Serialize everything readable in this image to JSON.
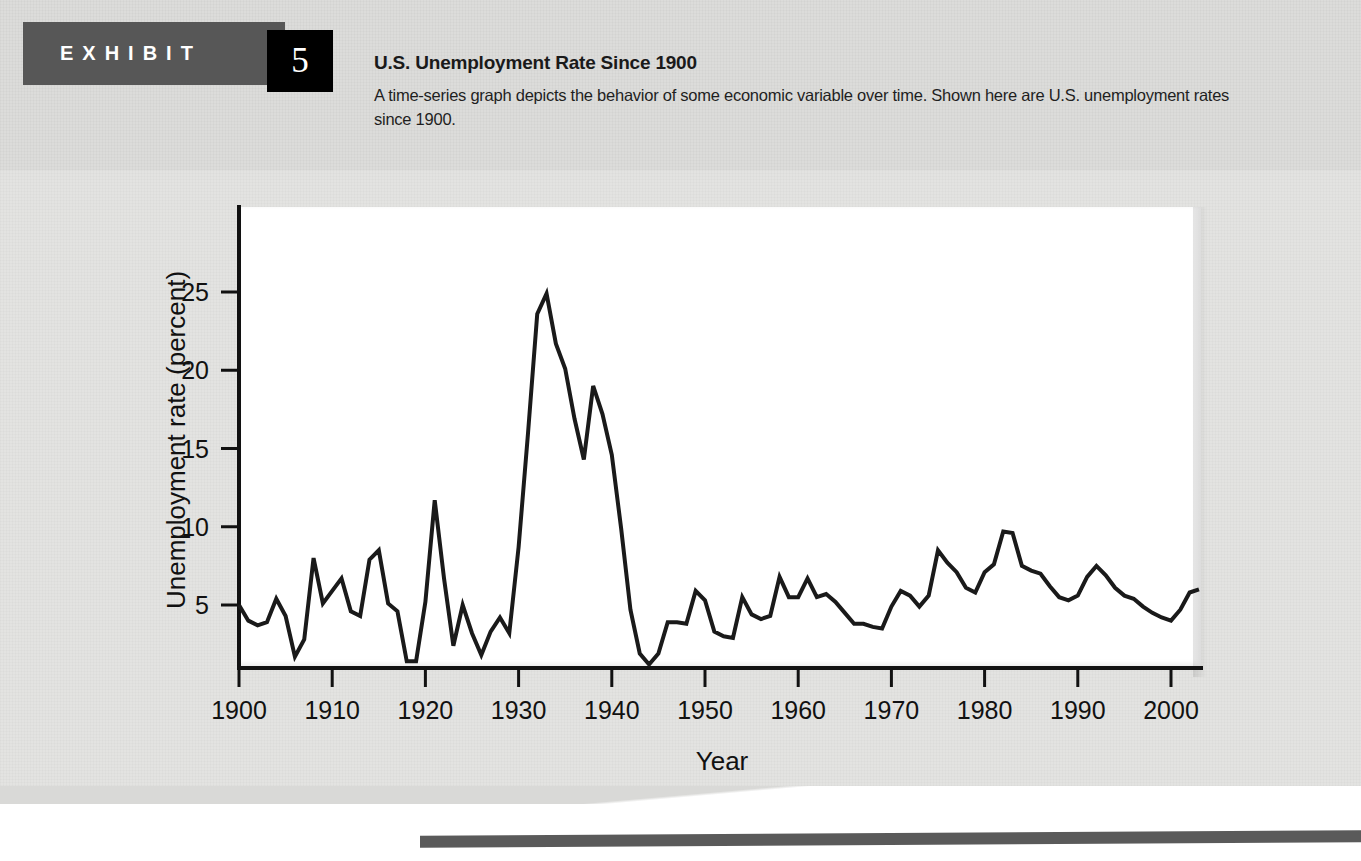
{
  "exhibit": {
    "banner_label": "EXHIBIT",
    "number": "5",
    "title": "U.S. Unemployment Rate Since 1900",
    "description": "A time-series graph depicts the behavior of some economic variable over time. Shown here are U.S. unemployment rates since 1900."
  },
  "chart_data": {
    "type": "line",
    "title": "U.S. Unemployment Rate Since 1900",
    "xlabel": "Year",
    "ylabel": "Unemployment rate (percent)",
    "xlim": [
      1900,
      2003
    ],
    "ylim": [
      0,
      28
    ],
    "grid": false,
    "legend": null,
    "xticks": [
      1900,
      1910,
      1920,
      1930,
      1940,
      1950,
      1960,
      1970,
      1980,
      1990,
      2000
    ],
    "xtick_labels": [
      "1900",
      "1910",
      "1920",
      "1930",
      "1940",
      "1950",
      "1960",
      "1970",
      "1980",
      "1990",
      "2000"
    ],
    "yticks": [
      5,
      10,
      15,
      20,
      25
    ],
    "ytick_labels": [
      "5",
      "10",
      "15",
      "20",
      "25"
    ],
    "line_color": "#1a1a1a",
    "line_width": 4,
    "x": [
      1900,
      1901,
      1902,
      1903,
      1904,
      1905,
      1906,
      1907,
      1908,
      1909,
      1910,
      1911,
      1912,
      1913,
      1914,
      1915,
      1916,
      1917,
      1918,
      1919,
      1920,
      1921,
      1922,
      1923,
      1924,
      1925,
      1926,
      1927,
      1928,
      1929,
      1930,
      1931,
      1932,
      1933,
      1934,
      1935,
      1936,
      1937,
      1938,
      1939,
      1940,
      1941,
      1942,
      1943,
      1944,
      1945,
      1946,
      1947,
      1948,
      1949,
      1950,
      1951,
      1952,
      1953,
      1954,
      1955,
      1956,
      1957,
      1958,
      1959,
      1960,
      1961,
      1962,
      1963,
      1964,
      1965,
      1966,
      1967,
      1968,
      1969,
      1970,
      1971,
      1972,
      1973,
      1974,
      1975,
      1976,
      1977,
      1978,
      1979,
      1980,
      1981,
      1982,
      1983,
      1984,
      1985,
      1986,
      1987,
      1988,
      1989,
      1990,
      1991,
      1992,
      1993,
      1994,
      1995,
      1996,
      1997,
      1998,
      1999,
      2000,
      2001,
      2002,
      2003
    ],
    "y": [
      5.0,
      4.0,
      3.7,
      3.9,
      5.4,
      4.3,
      1.7,
      2.8,
      8.0,
      5.1,
      5.9,
      6.7,
      4.6,
      4.3,
      7.9,
      8.5,
      5.1,
      4.6,
      1.4,
      1.4,
      5.2,
      11.7,
      6.7,
      2.4,
      5.0,
      3.2,
      1.8,
      3.3,
      4.2,
      3.2,
      8.7,
      15.9,
      23.6,
      24.9,
      21.7,
      20.1,
      16.9,
      14.3,
      19.0,
      17.2,
      14.6,
      9.9,
      4.7,
      1.9,
      1.2,
      1.9,
      3.9,
      3.9,
      3.8,
      5.9,
      5.3,
      3.3,
      3.0,
      2.9,
      5.5,
      4.4,
      4.1,
      4.3,
      6.8,
      5.5,
      5.5,
      6.7,
      5.5,
      5.7,
      5.2,
      4.5,
      3.8,
      3.8,
      3.6,
      3.5,
      4.9,
      5.9,
      5.6,
      4.9,
      5.6,
      8.5,
      7.7,
      7.1,
      6.1,
      5.8,
      7.1,
      7.6,
      9.7,
      9.6,
      7.5,
      7.2,
      7.0,
      6.2,
      5.5,
      5.3,
      5.6,
      6.8,
      7.5,
      6.9,
      6.1,
      5.6,
      5.4,
      4.9,
      4.5,
      4.2,
      4.0,
      4.7,
      5.8,
      6.0
    ]
  }
}
